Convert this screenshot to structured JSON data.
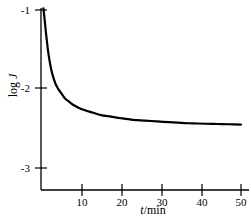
{
  "chart_data": {
    "type": "line",
    "title": "",
    "subtitle": "",
    "xlabel": "t/min",
    "xlabel_var": "t",
    "xlabel_unit": "/min",
    "ylabel": "log J",
    "ylabel_prefix": "log ",
    "ylabel_var": "J",
    "xlim": [
      0,
      50
    ],
    "ylim": [
      -3.35,
      -0.9
    ],
    "xticks": [
      10,
      20,
      30,
      40,
      50
    ],
    "xtick_labels": [
      "10",
      "20",
      "30",
      "40",
      "50"
    ],
    "yticks": [
      -1,
      -2,
      -3
    ],
    "ytick_labels": [
      "-1",
      "-2",
      "-3"
    ],
    "grid": false,
    "legend": "none",
    "series": [
      {
        "name": "log J vs t",
        "color": "#000000",
        "linewidth": 2.2,
        "x": [
          0.6,
          0.9,
          1.2,
          1.6,
          2.0,
          2.5,
          3.0,
          3.6,
          4.2,
          5.0,
          6.0,
          7.0,
          8.0,
          9.5,
          11.0,
          13.0,
          15.0,
          17.5,
          20.0,
          23.0,
          26.0,
          29.0,
          32.0,
          35.0,
          38.0,
          41.0,
          44.0,
          47.0,
          50.0
        ],
        "y": [
          -0.98,
          -1.12,
          -1.27,
          -1.45,
          -1.6,
          -1.74,
          -1.84,
          -1.93,
          -1.99,
          -2.05,
          -2.12,
          -2.16,
          -2.2,
          -2.24,
          -2.27,
          -2.3,
          -2.33,
          -2.35,
          -2.37,
          -2.39,
          -2.4,
          -2.41,
          -2.42,
          -2.43,
          -2.435,
          -2.44,
          -2.443,
          -2.446,
          -2.45
        ]
      }
    ],
    "annotations": [],
    "axis_color": "#000000",
    "background": "#ffffff"
  },
  "figure": {
    "ylabel_text": "log J",
    "xlabel_text": "t/min"
  }
}
